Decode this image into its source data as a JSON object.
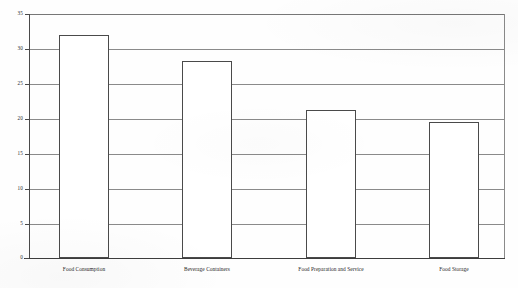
{
  "chart_data": {
    "type": "bar",
    "title": "",
    "subtitle": "",
    "xlabel": "",
    "ylabel": "",
    "categories": [
      "Food Consumption",
      "Beverage Containers",
      "Food Preparation and Service",
      "Food Storage"
    ],
    "values": [
      32.0,
      28.2,
      21.3,
      19.5
    ],
    "ylim": [
      0,
      35
    ],
    "yticks": [
      0,
      5,
      10,
      15,
      20,
      25,
      30,
      35
    ],
    "ytick_labels": [
      "0",
      "5",
      "10",
      "15",
      "20",
      "25",
      "30",
      "35"
    ],
    "grid": true,
    "grid_axis": "y",
    "legend": false,
    "legend_position": "none",
    "bar_fill": "#ffffff",
    "bar_edge": "#4a4a4a",
    "gridline_color": "#8a8a8a",
    "axis_color": "#3d3d3d"
  },
  "caption": {
    "ghost_text": "................ ....."
  }
}
